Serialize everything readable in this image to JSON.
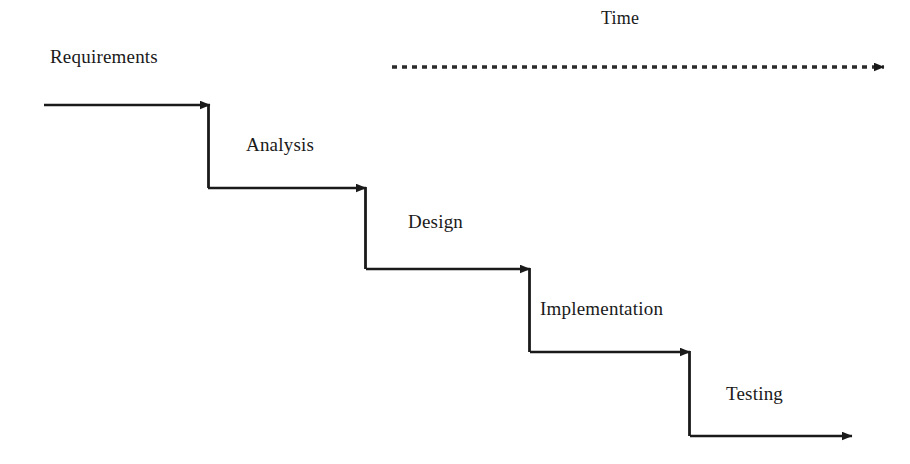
{
  "diagram": {
    "type": "waterfall-process-diagram",
    "background_color": "#ffffff",
    "line_color": "#1a1a1a",
    "text_color": "#1a1a1a",
    "width": 910,
    "height": 464,
    "time_axis": {
      "label": "Time",
      "label_x": 601,
      "label_y": 7,
      "line_style": "dashed",
      "start_x": 392,
      "end_x": 884,
      "y": 67,
      "dash_length": 5,
      "gap_length": 5,
      "arrowhead": "right"
    },
    "phases": [
      {
        "label": "Requirements",
        "label_x": 50,
        "label_y": 46,
        "line_start_x": 44,
        "line_y": 105,
        "arrow_x": 210,
        "drop_to_y": 188
      },
      {
        "label": "Analysis",
        "label_x": 246,
        "label_y": 134,
        "line_start_x": 208,
        "line_y": 188,
        "arrow_x": 366,
        "drop_to_y": 269
      },
      {
        "label": "Design",
        "label_x": 408,
        "label_y": 211,
        "line_start_x": 366,
        "line_y": 269,
        "arrow_x": 530,
        "drop_to_y": 352
      },
      {
        "label": "Implementation",
        "label_x": 540,
        "label_y": 298,
        "line_start_x": 530,
        "line_y": 352,
        "arrow_x": 690,
        "drop_to_y": 436
      },
      {
        "label": "Testing",
        "label_x": 726,
        "label_y": 383,
        "line_start_x": 690,
        "line_y": 436,
        "arrow_x": 852,
        "drop_to_y": null
      }
    ]
  }
}
